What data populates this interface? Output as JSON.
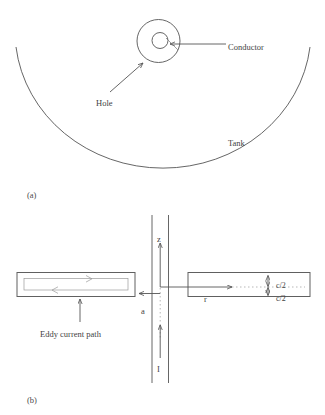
{
  "figure": {
    "panels": [
      {
        "id": "a",
        "caption": "(a)",
        "labels": {
          "conductor": "Conductor",
          "hole": "Hole",
          "tank": "Tank"
        }
      },
      {
        "id": "b",
        "caption": "(b)",
        "labels": {
          "eddy_current_path": "Eddy current path",
          "axis_z": "z",
          "axis_r": "r",
          "current": "I",
          "radius_a": "a",
          "half_thickness_upper": "c/2",
          "half_thickness_lower": "c/2"
        }
      }
    ],
    "colors": {
      "line": "#555555",
      "line_light": "#9a9a9a",
      "box": "#606060",
      "text": "#3f3f3f",
      "background": "#ffffff"
    }
  }
}
